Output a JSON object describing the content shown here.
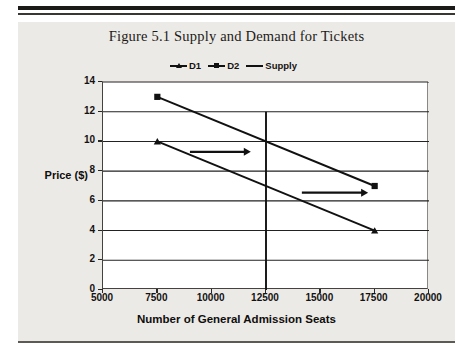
{
  "figure": {
    "title": "Figure 5.1  Supply and Demand for Tickets"
  },
  "chart_data": {
    "type": "line",
    "title": "Figure 5.1  Supply and Demand for Tickets",
    "xlabel": "Number of General Admission Seats",
    "ylabel": "Price ($)",
    "xlim": [
      5000,
      20000
    ],
    "ylim": [
      0,
      14
    ],
    "xticks": [
      "5000",
      "7500",
      "10000",
      "12500",
      "15000",
      "17500",
      "20000"
    ],
    "yticks": [
      "0",
      "2",
      "4",
      "6",
      "8",
      "10",
      "12",
      "14"
    ],
    "xtick_values": [
      5000,
      7500,
      10000,
      12500,
      15000,
      17500,
      20000
    ],
    "ytick_values": [
      0,
      2,
      4,
      6,
      8,
      10,
      12,
      14
    ],
    "grid": "horizontal",
    "legend_position": "top-center",
    "series": [
      {
        "name": "D1",
        "marker": "triangle",
        "color": "#111111",
        "points": [
          [
            7500,
            10
          ],
          [
            17500,
            4
          ]
        ]
      },
      {
        "name": "D2",
        "marker": "square",
        "color": "#111111",
        "points": [
          [
            7500,
            13
          ],
          [
            17500,
            7
          ]
        ]
      },
      {
        "name": "Supply",
        "marker": "none",
        "color": "#111111",
        "points": [
          [
            12500,
            0
          ],
          [
            12500,
            12
          ]
        ]
      }
    ],
    "annotations": [
      {
        "type": "arrow",
        "label": "shift-arrow-upper",
        "from": [
          9000,
          9.3
        ],
        "to": [
          11800,
          9.3
        ]
      },
      {
        "type": "arrow",
        "label": "shift-arrow-lower",
        "from": [
          14150,
          6.55
        ],
        "to": [
          17200,
          6.55
        ]
      }
    ]
  },
  "legend": {
    "items": [
      {
        "label": "D1",
        "marker": "triangle"
      },
      {
        "label": "D2",
        "marker": "square"
      },
      {
        "label": "Supply",
        "marker": "line"
      }
    ]
  }
}
